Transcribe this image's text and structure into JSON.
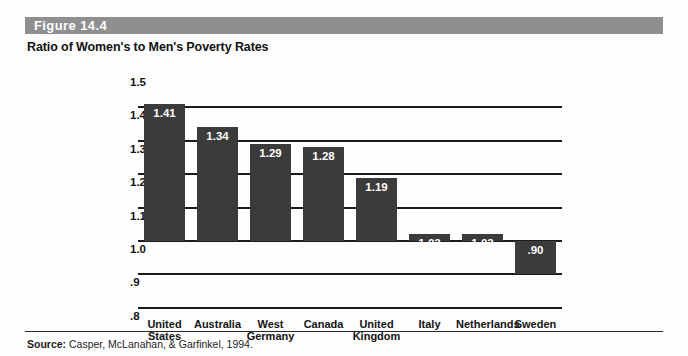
{
  "figure": {
    "band_label": "Figure 14.4",
    "title": "Ratio of Women's to Men's Poverty Rates",
    "source_label": "Source:",
    "source_text": " Casper, McLanahan, & Garfinkel, 1994."
  },
  "colors": {
    "band": "#8f8f8f",
    "bar": "#3b3b3b",
    "gridline": "#1b1b1b",
    "value_text": "#ffffff",
    "page": "#fdfdfd"
  },
  "chart_data": {
    "type": "bar",
    "title": "Ratio of Women's to Men's Poverty Rates",
    "xlabel": "",
    "ylabel": "",
    "ylim": [
      0.8,
      1.5
    ],
    "baseline": 1.0,
    "grid": true,
    "legend": "none",
    "ytick_labels": [
      "1.5",
      "1.4",
      "1.3",
      "1.2",
      "1.1",
      "1.0",
      ".9",
      ".8"
    ],
    "ytick_values": [
      1.5,
      1.4,
      1.3,
      1.2,
      1.1,
      1.0,
      0.9,
      0.8
    ],
    "categories": [
      "United States",
      "Australia",
      "West Germany",
      "Canada",
      "United Kingdom",
      "Italy",
      "Netherlands",
      "Sweden"
    ],
    "values": [
      1.41,
      1.34,
      1.29,
      1.28,
      1.19,
      1.02,
      1.02,
      0.9
    ],
    "value_labels": [
      "1.41",
      "1.34",
      "1.29",
      "1.28",
      "1.19",
      "1.02",
      "1.02",
      ".90"
    ],
    "category_lines": [
      [
        "United",
        "States"
      ],
      [
        "Australia",
        ""
      ],
      [
        "West",
        "Germany"
      ],
      [
        "Canada",
        ""
      ],
      [
        "United",
        "Kingdom"
      ],
      [
        "Italy",
        ""
      ],
      [
        "Netherlands",
        ""
      ],
      [
        "Sweden",
        ""
      ]
    ]
  }
}
